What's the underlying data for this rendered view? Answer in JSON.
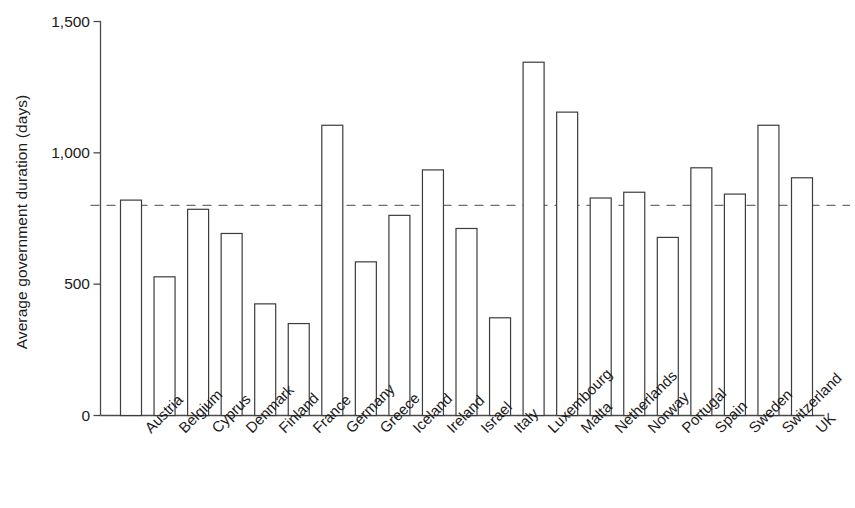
{
  "chart_data": {
    "type": "bar",
    "title": "",
    "subtitle": "",
    "xlabel": "",
    "ylabel": "Average government duration (days)",
    "ylim": [
      0,
      1500
    ],
    "yticks": [
      0,
      500,
      1000,
      1500
    ],
    "ytick_labels": [
      "0",
      "500",
      "1,000",
      "1,500"
    ],
    "grid": false,
    "legend": "none",
    "bar_style": {
      "fill": "#ffffff",
      "edge_color": "#3c3c3c",
      "edge_width": 1.2
    },
    "reference_line": {
      "value": 800,
      "style": "dashed",
      "color": "#6e6e6e",
      "label": ""
    },
    "categories": [
      "Austria",
      "Belgium",
      "Cyprus",
      "Denmark",
      "Finland",
      "France",
      "Germany",
      "Greece",
      "Iceland",
      "Ireland",
      "Israel",
      "Italy",
      "Luxembourg",
      "Malta",
      "Netherlands",
      "Norway",
      "Portugal",
      "Spain",
      "Sweden",
      "Switzerland",
      "UK"
    ],
    "values": [
      820,
      528,
      785,
      693,
      425,
      350,
      1105,
      585,
      762,
      935,
      712,
      372,
      1345,
      1155,
      828,
      850,
      678,
      943,
      843,
      1105,
      905
    ]
  },
  "axis": {
    "y_title": "Average government duration (days)"
  }
}
